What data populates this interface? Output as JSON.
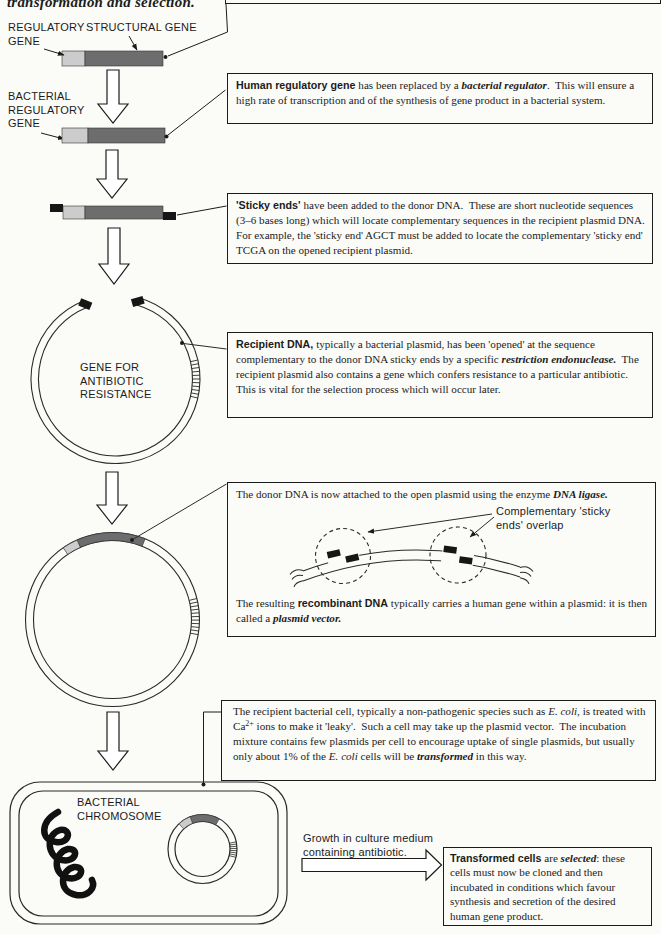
{
  "intro": {
    "segments": [
      {
        "t": "transformation",
        "b": true,
        "i": true
      },
      {
        "t": " and "
      },
      {
        "t": "selection",
        "b": true,
        "i": true
      },
      {
        "t": "."
      }
    ]
  },
  "diagram_labels": {
    "regulatory_gene": "REGULATORY\nGENE",
    "structural_gene": "STRUCTURAL GENE",
    "bacterial_regulatory_gene": "BACTERIAL\nREGULATORY\nGENE",
    "antibiotic_resistance_gene": "GENE FOR\nANTIBIOTIC\nRESISTANCE",
    "bacterial_chromosome": "BACTERIAL\nCHROMOSOME",
    "growth_medium": "Growth in culture medium\ncontaining antibiotic.",
    "sticky_overlap": "Complementary 'sticky\nends' overlap"
  },
  "boxes": {
    "human_regulator": [
      {
        "t": "Human regulatory gene ",
        "b": true,
        "s": true
      },
      {
        "t": "has been replaced by a "
      },
      {
        "t": "bacterial regulator",
        "b": true,
        "i": true
      },
      {
        "t": ".  This will ensure a high rate of transcription and of the synthesis of gene product in a bacterial system."
      }
    ],
    "sticky_ends": [
      {
        "t": "'Sticky ends' ",
        "b": true,
        "s": true
      },
      {
        "t": "have been added to the donor DNA.  These are short nucleotide sequences (3–6 bases long) which will locate complementary sequences in the recipient plasmid DNA.  For example, the 'sticky end' AGCT must be added to locate the complementary 'sticky end' TCGA on the opened recipient plasmid."
      }
    ],
    "recipient_dna": [
      {
        "t": "Recipient DNA, ",
        "b": true,
        "s": true
      },
      {
        "t": "typically a bacterial plasmid, has been 'opened' at the sequence complementary to the donor DNA sticky ends by a specific "
      },
      {
        "t": "restriction endonuclease.",
        "b": true,
        "i": true
      },
      {
        "t": "  The recipient plasmid also contains a gene which confers resistance to a particular antibiotic.  This is vital for the selection process which will occur later."
      }
    ],
    "ligase_line1": [
      {
        "t": "The donor DNA is now attached to the open plasmid using the enzyme "
      },
      {
        "t": "DNA ligase.",
        "b": true,
        "i": true
      }
    ],
    "ligase_line2": [
      {
        "t": "The resulting "
      },
      {
        "t": "recombinant DNA",
        "b": true,
        "s": true
      },
      {
        "t": " typically carries a human gene within a plasmid: it is then called a "
      },
      {
        "t": "plasmid vector.",
        "b": true,
        "i": true
      }
    ],
    "transformation": [
      {
        "t": "The recipient bacterial cell, typically a non-pathogenic species such as "
      },
      {
        "t": "E. coli",
        "i": true
      },
      {
        "t": ", is treated with Ca"
      },
      {
        "t": "2+",
        "sup": true
      },
      {
        "t": " ions to make it 'leaky'.  Such a cell may take up the plasmid vector.  The incubation mixture contains few plasmids per cell to encourage uptake of single plasmids, but usually only about 1% of the "
      },
      {
        "t": "E. coli",
        "i": true
      },
      {
        "t": " cells will be "
      },
      {
        "t": "transformed",
        "b": true,
        "i": true
      },
      {
        "t": " in this way."
      }
    ],
    "selection": [
      {
        "t": "Transformed cells",
        "b": true,
        "s": true
      },
      {
        "t": " are "
      },
      {
        "t": "selected",
        "b": true,
        "i": true
      },
      {
        "t": ": these cells must now be cloned and then incubated in conditions which favour synthesis and secretion of the desired human gene product."
      }
    ]
  },
  "colors": {
    "gene_light": "#cccccc",
    "gene_dark": "#6d6d6d",
    "ink": "#1c1c1c",
    "paper": "#fbfbf8"
  }
}
